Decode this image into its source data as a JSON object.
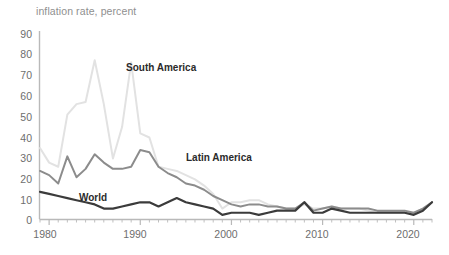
{
  "chart": {
    "title": "inflation rate, percent",
    "axis": {
      "y_ticks": [
        "90",
        "80",
        "70",
        "60",
        "50",
        "40",
        "30",
        "20",
        "10",
        "0"
      ],
      "x_ticks": [
        "1980",
        "1990",
        "2000",
        "2010",
        "2020"
      ]
    },
    "series_labels": {
      "south_america": "South America",
      "latin_america": "Latin America",
      "world": "World"
    },
    "colors": {
      "south_america": "#e2e2e2",
      "latin_america": "#8c8c8c",
      "world": "#3b3b3b",
      "axis": "#b9b9b9",
      "tick_text": "#6e6e6e",
      "title_text": "#8f8f8f"
    }
  },
  "chart_data": {
    "type": "line",
    "title": "inflation rate, percent",
    "xlabel": "",
    "ylabel": "inflation rate, percent",
    "xlim": [
      1979,
      2022
    ],
    "ylim": [
      0,
      90
    ],
    "grid": false,
    "legend": "inline-annotations",
    "x": [
      1979,
      1980,
      1981,
      1982,
      1983,
      1984,
      1985,
      1986,
      1987,
      1988,
      1989,
      1990,
      1991,
      1992,
      1993,
      1994,
      1995,
      1996,
      1997,
      1998,
      1999,
      2000,
      2001,
      2002,
      2003,
      2004,
      2005,
      2006,
      2007,
      2008,
      2009,
      2010,
      2011,
      2012,
      2013,
      2014,
      2015,
      2016,
      2017,
      2018,
      2019,
      2020,
      2021,
      2022
    ],
    "series": [
      {
        "name": "South America",
        "color": "#e2e2e2",
        "values": [
          34,
          27,
          25,
          50,
          55,
          56,
          76,
          55,
          29,
          44,
          75,
          41,
          39,
          25,
          24,
          23,
          21,
          19,
          16,
          12,
          5,
          8,
          8,
          9,
          9,
          7,
          6,
          5,
          5,
          7,
          5,
          5,
          6,
          5,
          5,
          5,
          4,
          3,
          3,
          3,
          3,
          3,
          5,
          8
        ]
      },
      {
        "name": "Latin America",
        "color": "#8c8c8c",
        "values": [
          23,
          21,
          17,
          30,
          20,
          24,
          31,
          27,
          24,
          24,
          25,
          33,
          32,
          25,
          22,
          20,
          17,
          16,
          14,
          11,
          9,
          7,
          6,
          7,
          7,
          6,
          6,
          5,
          5,
          8,
          4,
          5,
          6,
          5,
          5,
          5,
          5,
          4,
          4,
          4,
          4,
          3,
          5,
          8
        ]
      },
      {
        "name": "World",
        "color": "#3b3b3b",
        "values": [
          13,
          12,
          11,
          10,
          9,
          8,
          7,
          5,
          5,
          6,
          7,
          8,
          8,
          6,
          8,
          10,
          8,
          7,
          6,
          5,
          2,
          3,
          3,
          3,
          2,
          3,
          4,
          4,
          4,
          8,
          3,
          3,
          5,
          4,
          3,
          3,
          3,
          3,
          3,
          3,
          3,
          2,
          4,
          8
        ]
      }
    ]
  }
}
